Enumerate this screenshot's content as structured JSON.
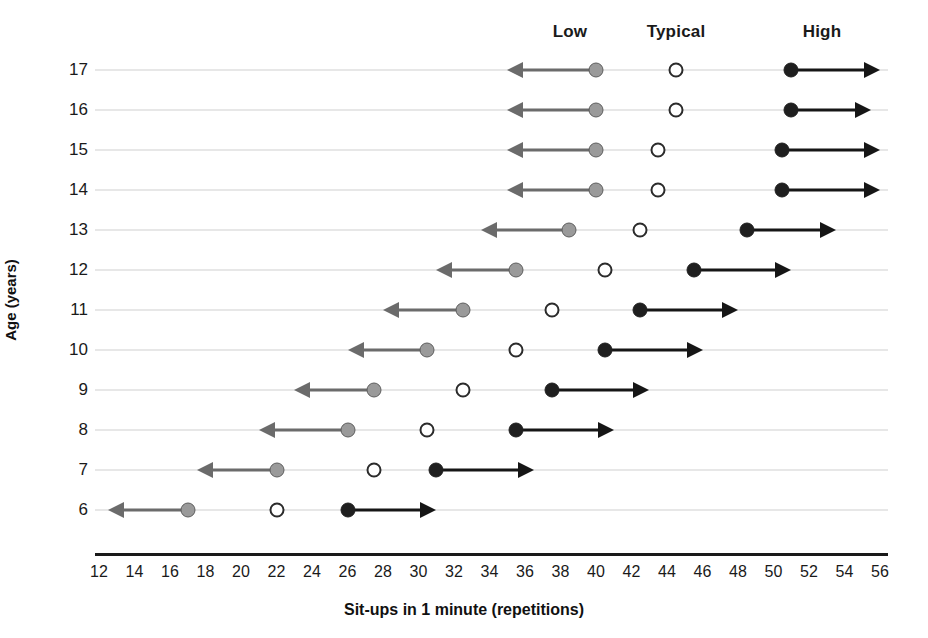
{
  "chart_data": {
    "type": "scatter",
    "title": "",
    "xlabel": "Sit-ups in 1 minute (repetitions)",
    "ylabel": "Age (years)",
    "xlim": [
      12,
      56
    ],
    "xticks": [
      12,
      14,
      16,
      18,
      20,
      22,
      24,
      26,
      28,
      30,
      32,
      34,
      36,
      38,
      40,
      42,
      44,
      46,
      48,
      50,
      52,
      54,
      56
    ],
    "yticks": [
      17,
      16,
      15,
      14,
      13,
      12,
      11,
      10,
      9,
      8,
      7,
      6
    ],
    "grid": true,
    "legend_position": "top",
    "column_headers": [
      "Low",
      "Typical",
      "High"
    ],
    "series": [
      {
        "name": "Low",
        "marker": "filled-gray-circle",
        "arrow": "left",
        "color": "#9a9a9a"
      },
      {
        "name": "Typical",
        "marker": "open-circle",
        "arrow": "none",
        "color": "#ffffff"
      },
      {
        "name": "High",
        "marker": "filled-black-circle",
        "arrow": "right",
        "color": "#1f1f1f"
      }
    ],
    "rows": [
      {
        "age": 17,
        "low": 40.0,
        "typical": 44.5,
        "high": 51.0,
        "low_arrow_end": 35.0,
        "high_arrow_end": 56.0
      },
      {
        "age": 16,
        "low": 40.0,
        "typical": 44.5,
        "high": 51.0,
        "low_arrow_end": 35.0,
        "high_arrow_end": 55.5
      },
      {
        "age": 15,
        "low": 40.0,
        "typical": 43.5,
        "high": 50.5,
        "low_arrow_end": 35.0,
        "high_arrow_end": 56.0
      },
      {
        "age": 14,
        "low": 40.0,
        "typical": 43.5,
        "high": 50.5,
        "low_arrow_end": 35.0,
        "high_arrow_end": 56.0
      },
      {
        "age": 13,
        "low": 38.5,
        "typical": 42.5,
        "high": 48.5,
        "low_arrow_end": 33.5,
        "high_arrow_end": 53.5
      },
      {
        "age": 12,
        "low": 35.5,
        "typical": 40.5,
        "high": 45.5,
        "low_arrow_end": 31.0,
        "high_arrow_end": 51.0
      },
      {
        "age": 11,
        "low": 32.5,
        "typical": 37.5,
        "high": 42.5,
        "low_arrow_end": 28.0,
        "high_arrow_end": 48.0
      },
      {
        "age": 10,
        "low": 30.5,
        "typical": 35.5,
        "high": 40.5,
        "low_arrow_end": 26.0,
        "high_arrow_end": 46.0
      },
      {
        "age": 9,
        "low": 27.5,
        "typical": 32.5,
        "high": 37.5,
        "low_arrow_end": 23.0,
        "high_arrow_end": 43.0
      },
      {
        "age": 8,
        "low": 26.0,
        "typical": 30.5,
        "high": 35.5,
        "low_arrow_end": 21.0,
        "high_arrow_end": 41.0
      },
      {
        "age": 7,
        "low": 22.0,
        "typical": 27.5,
        "high": 31.0,
        "low_arrow_end": 17.5,
        "high_arrow_end": 36.5
      },
      {
        "age": 6,
        "low": 17.0,
        "typical": 22.0,
        "high": 26.0,
        "low_arrow_end": 12.5,
        "high_arrow_end": 31.0
      }
    ]
  }
}
